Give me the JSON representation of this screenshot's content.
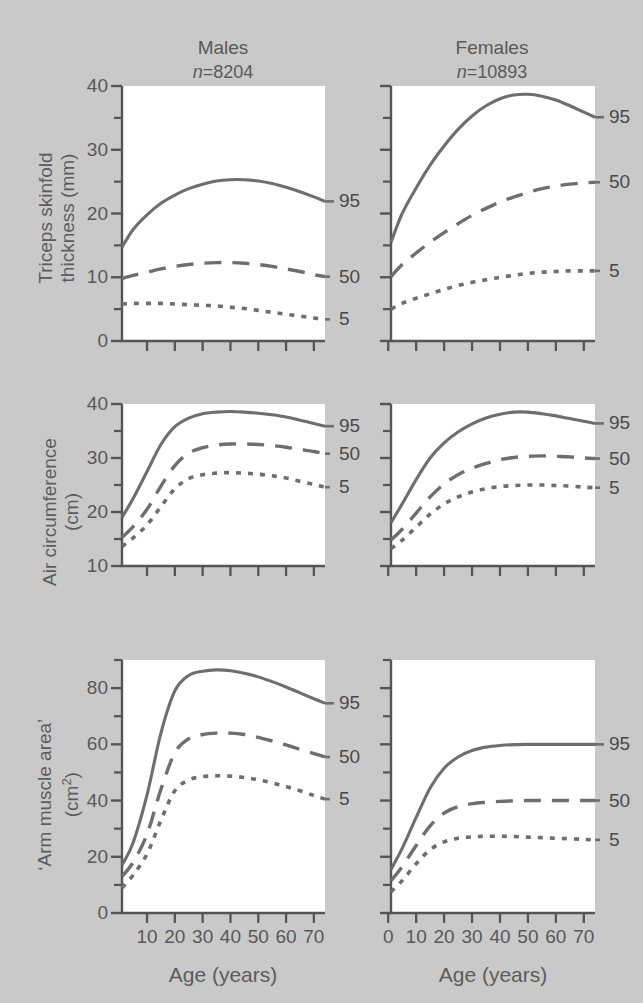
{
  "figure": {
    "background_color": "#c9c9c9",
    "curve_color": "#6e6e6e",
    "axis_color": "#555555"
  },
  "columns": [
    {
      "title": "Males",
      "n_prefix": "n",
      "n_value": "=8204"
    },
    {
      "title": "Females",
      "n_prefix": "n",
      "n_value": "=10893"
    }
  ],
  "percentiles": {
    "p95": "95",
    "p50": "50",
    "p5": "5"
  },
  "axis_titles": {
    "x": "Age (years)",
    "row1_y_line1": "Triceps skinfold",
    "row1_y_line2": "thickness (mm)",
    "row2_y_line1": "Air circumference",
    "row2_y_line2": "(cm)",
    "row3_y_line1": "‘Arm muscle area’",
    "row3_y_line2_pre": "(cm",
    "row3_y_line2_sup": "2",
    "row3_y_line2_post": ")"
  },
  "yticks": {
    "row1": [
      "40",
      "30",
      "20",
      "10",
      "0"
    ],
    "row2": [
      "40",
      "30",
      "20",
      "10"
    ],
    "row3": [
      "80",
      "60",
      "40",
      "20",
      "0"
    ]
  },
  "xticks": {
    "males": [
      "10",
      "20",
      "30",
      "40",
      "50",
      "60",
      "70"
    ],
    "females": [
      "0",
      "10",
      "20",
      "30",
      "40",
      "50",
      "60",
      "70"
    ]
  },
  "chart_data": {
    "type": "line",
    "xlabel": "Age (years)",
    "x_units": "years",
    "grid": false,
    "legend_position": "right-of-panel (curve end labels)",
    "legend_entries": [
      "95",
      "50",
      "5"
    ],
    "line_styles": {
      "95": "solid",
      "50": "dashed",
      "5": "dotted"
    },
    "panels": [
      {
        "row": 1,
        "sex": "Males",
        "n": 8204,
        "ylabel": "Triceps skinfold thickness (mm)",
        "yunits": "mm",
        "ylim": [
          0,
          40
        ],
        "ytick_major": [
          0,
          10,
          20,
          30,
          40
        ],
        "ytick_minor": [
          5,
          15,
          25,
          35
        ],
        "xlim": [
          1,
          74
        ],
        "xtick_major": [
          10,
          20,
          30,
          40,
          50,
          60,
          70
        ],
        "series": [
          {
            "name": "95",
            "x": [
              1,
              5,
              10,
              15,
              20,
              25,
              30,
              35,
              40,
              45,
              50,
              55,
              60,
              65,
              70,
              74
            ],
            "values": [
              14.7,
              17.5,
              19.8,
              21.6,
              22.9,
              23.9,
              24.6,
              25.1,
              25.3,
              25.3,
              25.1,
              24.7,
              24.1,
              23.4,
              22.6,
              21.9
            ]
          },
          {
            "name": "50",
            "x": [
              1,
              5,
              10,
              15,
              20,
              25,
              30,
              35,
              40,
              45,
              50,
              55,
              60,
              65,
              70,
              74
            ],
            "values": [
              9.8,
              10.3,
              10.8,
              11.3,
              11.7,
              12.0,
              12.2,
              12.3,
              12.3,
              12.2,
              12.0,
              11.7,
              11.3,
              10.9,
              10.4,
              10.1
            ]
          },
          {
            "name": "5",
            "x": [
              1,
              5,
              10,
              15,
              20,
              25,
              30,
              35,
              40,
              45,
              50,
              55,
              60,
              65,
              70,
              74
            ],
            "values": [
              5.8,
              5.9,
              5.9,
              5.9,
              5.8,
              5.7,
              5.6,
              5.5,
              5.3,
              5.1,
              4.8,
              4.5,
              4.2,
              3.9,
              3.6,
              3.4
            ]
          }
        ]
      },
      {
        "row": 1,
        "sex": "Females",
        "n": 10893,
        "ylabel": "Triceps skinfold thickness (mm)",
        "yunits": "mm",
        "ylim": [
          0,
          40
        ],
        "ytick_major": [
          0,
          10,
          20,
          30,
          40
        ],
        "ytick_minor": [
          5,
          15,
          25,
          35
        ],
        "xlim": [
          1,
          74
        ],
        "xtick_major": [
          0,
          10,
          20,
          30,
          40,
          50,
          60,
          70
        ],
        "series": [
          {
            "name": "95",
            "x": [
              1,
              5,
              10,
              15,
              20,
              25,
              30,
              35,
              40,
              45,
              50,
              55,
              60,
              65,
              70,
              74
            ],
            "values": [
              15.5,
              20.0,
              24.0,
              27.6,
              30.6,
              33.2,
              35.3,
              36.9,
              38.0,
              38.6,
              38.7,
              38.4,
              37.8,
              36.9,
              35.9,
              35.1
            ]
          },
          {
            "name": "50",
            "x": [
              1,
              5,
              10,
              15,
              20,
              25,
              30,
              35,
              40,
              45,
              50,
              55,
              60,
              65,
              70,
              74
            ],
            "values": [
              10.1,
              12.0,
              13.8,
              15.5,
              17.0,
              18.4,
              19.7,
              20.8,
              21.8,
              22.6,
              23.3,
              23.9,
              24.3,
              24.6,
              24.8,
              24.9
            ]
          },
          {
            "name": "5",
            "x": [
              1,
              5,
              10,
              15,
              20,
              25,
              30,
              35,
              40,
              45,
              50,
              55,
              60,
              65,
              70,
              74
            ],
            "values": [
              5.0,
              5.9,
              6.7,
              7.4,
              8.1,
              8.7,
              9.2,
              9.6,
              10.0,
              10.3,
              10.6,
              10.8,
              10.9,
              11.0,
              11.0,
              11.0
            ]
          }
        ]
      },
      {
        "row": 2,
        "sex": "Males",
        "n": 8204,
        "ylabel": "Air circumference (cm)",
        "yunits": "cm",
        "ylim": [
          10,
          40
        ],
        "ytick_major": [
          10,
          20,
          30,
          40
        ],
        "ytick_minor": [
          15,
          25,
          35
        ],
        "xlim": [
          1,
          74
        ],
        "xtick_major": [
          10,
          20,
          30,
          40,
          50,
          60,
          70
        ],
        "series": [
          {
            "name": "95",
            "x": [
              1,
              5,
              10,
              15,
              20,
              25,
              30,
              35,
              40,
              45,
              50,
              55,
              60,
              65,
              70,
              74
            ],
            "values": [
              19.0,
              22.5,
              27.5,
              32.5,
              35.8,
              37.4,
              38.2,
              38.5,
              38.6,
              38.5,
              38.3,
              38.0,
              37.6,
              37.0,
              36.4,
              35.9
            ]
          },
          {
            "name": "50",
            "x": [
              1,
              5,
              10,
              15,
              20,
              25,
              30,
              35,
              40,
              45,
              50,
              55,
              60,
              65,
              70,
              74
            ],
            "values": [
              15.3,
              17.3,
              20.5,
              24.8,
              28.6,
              30.9,
              31.9,
              32.4,
              32.6,
              32.6,
              32.5,
              32.3,
              32.0,
              31.6,
              31.2,
              30.8
            ]
          },
          {
            "name": "5",
            "x": [
              1,
              5,
              10,
              15,
              20,
              25,
              30,
              35,
              40,
              45,
              50,
              55,
              60,
              65,
              70,
              74
            ],
            "values": [
              13.6,
              15.2,
              17.6,
              21.0,
              24.3,
              26.2,
              26.9,
              27.2,
              27.3,
              27.2,
              27.0,
              26.7,
              26.3,
              25.7,
              25.1,
              24.6
            ]
          }
        ]
      },
      {
        "row": 2,
        "sex": "Females",
        "n": 10893,
        "ylabel": "Air circumference (cm)",
        "yunits": "cm",
        "ylim": [
          10,
          40
        ],
        "ytick_major": [
          10,
          20,
          30,
          40
        ],
        "ytick_minor": [
          15,
          25,
          35
        ],
        "xlim": [
          1,
          74
        ],
        "xtick_major": [
          0,
          10,
          20,
          30,
          40,
          50,
          60,
          70
        ],
        "series": [
          {
            "name": "95",
            "x": [
              1,
              5,
              10,
              15,
              20,
              25,
              30,
              35,
              40,
              45,
              50,
              55,
              60,
              65,
              70,
              74
            ],
            "values": [
              18.0,
              21.5,
              26.0,
              30.0,
              32.8,
              34.8,
              36.3,
              37.4,
              38.1,
              38.5,
              38.5,
              38.2,
              37.8,
              37.3,
              36.8,
              36.4
            ]
          },
          {
            "name": "50",
            "x": [
              1,
              5,
              10,
              15,
              20,
              25,
              30,
              35,
              40,
              45,
              50,
              55,
              60,
              65,
              70,
              74
            ],
            "values": [
              14.8,
              16.8,
              19.8,
              22.8,
              25.2,
              26.9,
              28.1,
              29.0,
              29.7,
              30.1,
              30.3,
              30.4,
              30.3,
              30.2,
              30.0,
              29.9
            ]
          },
          {
            "name": "5",
            "x": [
              1,
              5,
              10,
              15,
              20,
              25,
              30,
              35,
              40,
              45,
              50,
              55,
              60,
              65,
              70,
              74
            ],
            "values": [
              13.2,
              14.8,
              17.2,
              19.6,
              21.5,
              22.8,
              23.7,
              24.3,
              24.7,
              24.9,
              25.0,
              25.0,
              24.9,
              24.8,
              24.6,
              24.5
            ]
          }
        ]
      },
      {
        "row": 3,
        "sex": "Males",
        "n": 8204,
        "ylabel": "'Arm muscle area' (cm2)",
        "yunits": "cm2",
        "ylim": [
          0,
          90
        ],
        "ytick_major": [
          0,
          20,
          40,
          60,
          80
        ],
        "ytick_minor": [
          10,
          30,
          50,
          70,
          90
        ],
        "xlim": [
          1,
          74
        ],
        "xtick_major": [
          10,
          20,
          30,
          40,
          50,
          60,
          70
        ],
        "series": [
          {
            "name": "95",
            "x": [
              1,
              5,
              10,
              15,
              20,
              25,
              30,
              35,
              40,
              45,
              50,
              55,
              60,
              65,
              70,
              74
            ],
            "values": [
              17.0,
              25.0,
              42.0,
              64.0,
              79.0,
              84.5,
              86.0,
              86.5,
              86.2,
              85.3,
              84.0,
              82.3,
              80.4,
              78.3,
              76.2,
              74.6
            ]
          },
          {
            "name": "50",
            "x": [
              1,
              5,
              10,
              15,
              20,
              25,
              30,
              35,
              40,
              45,
              50,
              55,
              60,
              65,
              70,
              74
            ],
            "values": [
              13.0,
              18.0,
              28.0,
              44.0,
              57.0,
              62.0,
              63.5,
              64.0,
              64.0,
              63.5,
              62.5,
              61.2,
              59.8,
              58.2,
              56.7,
              55.5
            ]
          },
          {
            "name": "5",
            "x": [
              1,
              5,
              10,
              15,
              20,
              25,
              30,
              35,
              40,
              45,
              50,
              55,
              60,
              65,
              70,
              74
            ],
            "values": [
              9.0,
              13.5,
              21.0,
              33.0,
              43.5,
              47.3,
              48.5,
              48.8,
              48.7,
              48.2,
              47.4,
              46.3,
              45.0,
              43.5,
              41.8,
              40.5
            ]
          }
        ]
      },
      {
        "row": 3,
        "sex": "Females",
        "n": 10893,
        "ylabel": "'Arm muscle area' (cm2)",
        "yunits": "cm2",
        "ylim": [
          0,
          90
        ],
        "ytick_major": [
          0,
          20,
          40,
          60,
          80
        ],
        "ytick_minor": [
          10,
          30,
          50,
          70,
          90
        ],
        "xlim": [
          1,
          74
        ],
        "xtick_major": [
          0,
          10,
          20,
          30,
          40,
          50,
          60,
          70
        ],
        "series": [
          {
            "name": "95",
            "x": [
              1,
              5,
              10,
              15,
              20,
              25,
              30,
              35,
              40,
              45,
              50,
              55,
              60,
              65,
              70,
              74
            ],
            "values": [
              15.5,
              23.0,
              34.0,
              44.5,
              51.5,
              55.5,
              57.8,
              59.0,
              59.6,
              59.9,
              60.0,
              60.0,
              60.0,
              60.0,
              60.0,
              60.0
            ]
          },
          {
            "name": "50",
            "x": [
              1,
              5,
              10,
              15,
              20,
              25,
              30,
              35,
              40,
              45,
              50,
              55,
              60,
              65,
              70,
              74
            ],
            "values": [
              11.5,
              16.5,
              24.0,
              31.0,
              35.5,
              37.8,
              38.9,
              39.4,
              39.7,
              39.9,
              40.0,
              40.0,
              40.0,
              40.0,
              40.0,
              40.0
            ]
          },
          {
            "name": "5",
            "x": [
              1,
              5,
              10,
              15,
              20,
              25,
              30,
              35,
              40,
              45,
              50,
              55,
              60,
              65,
              70,
              74
            ],
            "values": [
              7.5,
              11.5,
              17.5,
              22.5,
              25.3,
              26.6,
              27.1,
              27.3,
              27.3,
              27.2,
              27.0,
              26.8,
              26.6,
              26.4,
              26.2,
              26.0
            ]
          }
        ]
      }
    ]
  }
}
